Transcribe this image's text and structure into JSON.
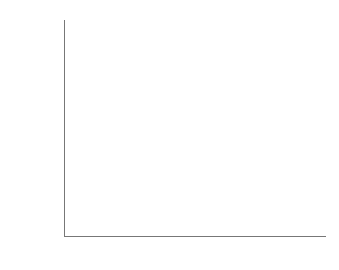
{
  "chart_data": {
    "type": "bar",
    "title": "",
    "xlabel": "",
    "ylabel": "Percentage 'Very happy'",
    "categories": [
      "Men",
      "Women"
    ],
    "series": [
      {
        "name": "married",
        "values": [
          38.5,
          42.5
        ],
        "color": "#8c8c8c"
      },
      {
        "name": "never married",
        "values": [
          20,
          25
        ],
        "color": "#c6c6c6"
      }
    ],
    "ylim": [
      0,
      45
    ],
    "yticks": [
      "0%",
      "5%",
      "10%",
      "15%",
      "20%",
      "25%",
      "30%",
      "35%",
      "40%",
      "45%"
    ],
    "grid": false,
    "legend": "labels inside bars"
  }
}
